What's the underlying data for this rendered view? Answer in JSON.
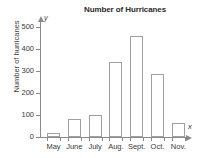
{
  "chart_data": {
    "type": "bar",
    "title": "Number of Hurricanes",
    "xlabel": "",
    "ylabel": "Number of hurricanes",
    "x_axis_variable": "x",
    "y_axis_variable": "y",
    "categories": [
      "May",
      "June",
      "July",
      "Aug.",
      "Sept.",
      "Oct.",
      "Nov."
    ],
    "values": [
      20,
      80,
      100,
      340,
      460,
      285,
      65
    ],
    "ylim": [
      0,
      550
    ],
    "ytick_labels": [
      "0",
      "100",
      "200",
      "300",
      "400",
      "500"
    ],
    "ytick_values": [
      0,
      100,
      200,
      300,
      400,
      500
    ],
    "grid": false,
    "legend": false,
    "bar_fill_color": "#ffffff",
    "bar_edge_color": "#a0a0a0",
    "axis_color": "#8a8a8a",
    "text_color": "#3a3a3a"
  }
}
